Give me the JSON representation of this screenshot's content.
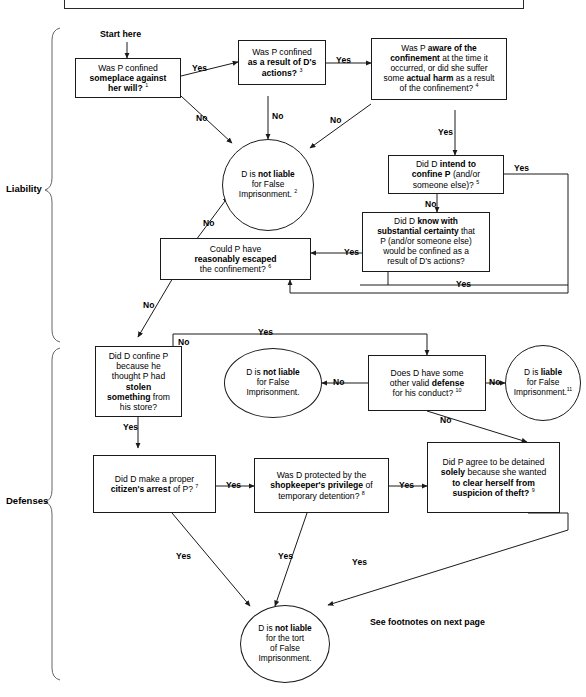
{
  "document": {
    "title_box_text": "",
    "section_labels": [
      {
        "name": "liability",
        "label": "Liability"
      },
      {
        "name": "defenses",
        "label": "Defenses"
      }
    ],
    "footer_note": "See footnotes on next page",
    "start_label": "Start here"
  },
  "flow": {
    "nodes": [
      {
        "id": "q1",
        "shape": "box",
        "html": "Was P confined<br><b>someplace against<br>her will?</b> <sup>1</sup>",
        "plain": "Was P confined someplace against her will? 1"
      },
      {
        "id": "q3",
        "shape": "box",
        "html": "Was P confined<br><b>as a result of D's<br>actions?</b> <sup>3</sup>",
        "plain": "Was P confined as a result of D's actions? 3"
      },
      {
        "id": "q4",
        "shape": "box",
        "html": "Was P <b>aware of the<br>confinement</b> at the time it<br>occurred, or did she suffer<br>some <b>actual harm</b> as a result<br>of the confinement? <sup>4</sup>",
        "plain": "Was P aware of the confinement at the time it occurred, or did she suffer some actual harm as a result of the confinement? 4"
      },
      {
        "id": "not-liable-2",
        "shape": "circle",
        "html": "D is <b>not liable</b><br>for False<br>Imprisonment. <sup>2</sup>",
        "plain": "D is not liable for False Imprisonment. 2"
      },
      {
        "id": "q5",
        "shape": "box",
        "html": "Did D <b>intend to<br>confine P</b> (and/or<br>someone else)? <sup>5</sup>",
        "plain": "Did D intend to confine P (and/or someone else)? 5"
      },
      {
        "id": "q-substantial-certainty",
        "shape": "box",
        "html": "Did D <b>know with<br>substantial certainty</b> that<br>P (and/or someone else)<br>would be confined as a<br>result of D's actions?",
        "plain": "Did D know with substantial certainty that P (and/or someone else) would be confined as a result of D's actions?"
      },
      {
        "id": "q6",
        "shape": "box",
        "html": "Could P have<br><b>reasonably escaped</b><br>the confinement? <sup>6</sup>",
        "plain": "Could P have reasonably escaped the confinement? 6"
      },
      {
        "id": "q-stolen",
        "shape": "box",
        "html": "Did D confine P<br>because he<br>thought P had<br><b>stolen<br>something</b> from<br>his store?",
        "plain": "Did D confine P because he thought P had stolen something from his store?"
      },
      {
        "id": "not-liable-mid",
        "shape": "circle",
        "html": "D is <b>not liable</b><br>for False<br>Imprisonment.",
        "plain": "D is not liable for False Imprisonment."
      },
      {
        "id": "q10",
        "shape": "box",
        "html": "Does D have some<br>other valid <b>defense</b><br>for his conduct? <sup>10</sup>",
        "plain": "Does D have some other valid defense for his conduct? 10"
      },
      {
        "id": "liable-11",
        "shape": "circle",
        "html": "D is <b>liable</b><br>for False<br>Imprisonment.<sup>11</sup>",
        "plain": "D is liable for False Imprisonment. 11"
      },
      {
        "id": "q7",
        "shape": "box",
        "html": "Did D make a proper<br><b>citizen's arrest</b> of P? <sup>7</sup>",
        "plain": "Did D make a proper citizen's arrest of P? 7"
      },
      {
        "id": "q8",
        "shape": "box",
        "html": "Was D protected by the<br><b>shopkeeper's privilege</b> of<br>temporary detention? <sup>8</sup>",
        "plain": "Was D protected by the shopkeeper's privilege of temporary detention? 8"
      },
      {
        "id": "q9",
        "shape": "box",
        "html": "Did P agree to be detained<br><b>solely</b> because she wanted<br><b>to clear herself from<br>suspicion of theft?</b> <sup>9</sup>",
        "plain": "Did P agree to be detained solely because she wanted to clear herself from suspicion of theft? 9"
      },
      {
        "id": "not-liable-tort",
        "shape": "circle",
        "html": "D is <b>not liable</b><br>for the tort<br>of False<br>Imprisonment.",
        "plain": "D is not liable for the tort of False Imprisonment."
      }
    ],
    "edge_labels": [
      {
        "id": "e1",
        "text": "Yes"
      },
      {
        "id": "e2",
        "text": "No"
      },
      {
        "id": "e3",
        "text": "Yes"
      },
      {
        "id": "e4",
        "text": "No"
      },
      {
        "id": "e5",
        "text": "No"
      },
      {
        "id": "e6",
        "text": "Yes"
      },
      {
        "id": "e7",
        "text": "Yes"
      },
      {
        "id": "e8",
        "text": "No"
      },
      {
        "id": "e9",
        "text": "Yes"
      },
      {
        "id": "e10",
        "text": "Yes"
      },
      {
        "id": "e11",
        "text": "No"
      },
      {
        "id": "e12",
        "text": "No"
      },
      {
        "id": "e13",
        "text": "No"
      },
      {
        "id": "e14",
        "text": "Yes"
      },
      {
        "id": "e15",
        "text": "Yes"
      },
      {
        "id": "e16",
        "text": "No"
      },
      {
        "id": "e17",
        "text": "No"
      },
      {
        "id": "e18",
        "text": "No"
      },
      {
        "id": "e19",
        "text": "Yes"
      },
      {
        "id": "e20",
        "text": "Yes"
      },
      {
        "id": "e21",
        "text": "Yes"
      }
    ]
  },
  "style": {
    "line_color": "#1a1a1a",
    "text_color": "#000000",
    "background": "#ffffff"
  }
}
